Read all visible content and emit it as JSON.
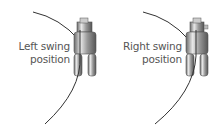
{
  "panels": [
    {
      "label_line1": "Left swing",
      "label_line2": "position",
      "side": "left"
    },
    {
      "label_line1": "Right swing",
      "label_line2": "position",
      "side": "right"
    }
  ],
  "colors": {
    "text": "#555555",
    "thread": "#333333",
    "foot": "#888888"
  }
}
